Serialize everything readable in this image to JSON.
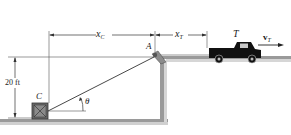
{
  "diagram": {
    "type": "mechanics-pulley-truck-crate",
    "labels": {
      "xc": {
        "main": "x",
        "sub": "C"
      },
      "xt": {
        "main": "x",
        "sub": "T"
      },
      "pulley": "A",
      "truck": "T",
      "velocity": {
        "main": "v",
        "sub": "T"
      },
      "crate": "C",
      "height": "20 ft",
      "angle": "θ"
    },
    "colors": {
      "line": "#222222",
      "ground": "#9a9a9a",
      "ground_shadow": "#c8c8c8",
      "crate": "#6a6a6a",
      "truck": "#111111"
    }
  }
}
